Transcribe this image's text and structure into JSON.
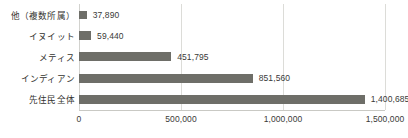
{
  "chart_data": {
    "type": "bar",
    "orientation": "horizontal",
    "title": "",
    "xlabel": "",
    "ylabel": "",
    "categories": [
      "他（複数所属）",
      "イヌイット",
      "メティス",
      "インディアン",
      "先住民全体"
    ],
    "values": [
      37890,
      59440,
      451795,
      851560,
      1400685
    ],
    "value_labels": [
      "37,890",
      "59,440",
      "451,795",
      "851,560",
      "1,400,685"
    ],
    "xlim": [
      0,
      1500000
    ],
    "xticks": [
      0,
      500000,
      1000000,
      1500000
    ],
    "xtick_labels": [
      "0",
      "500,000",
      "1,000,000",
      "1,500,000"
    ],
    "grid": true,
    "grid_axis": "x",
    "legend": false,
    "bar_color": "#6e6e68",
    "gridline_color": "#dcdcd8",
    "text_color": "#33332f",
    "background_color": "#ffffff"
  }
}
